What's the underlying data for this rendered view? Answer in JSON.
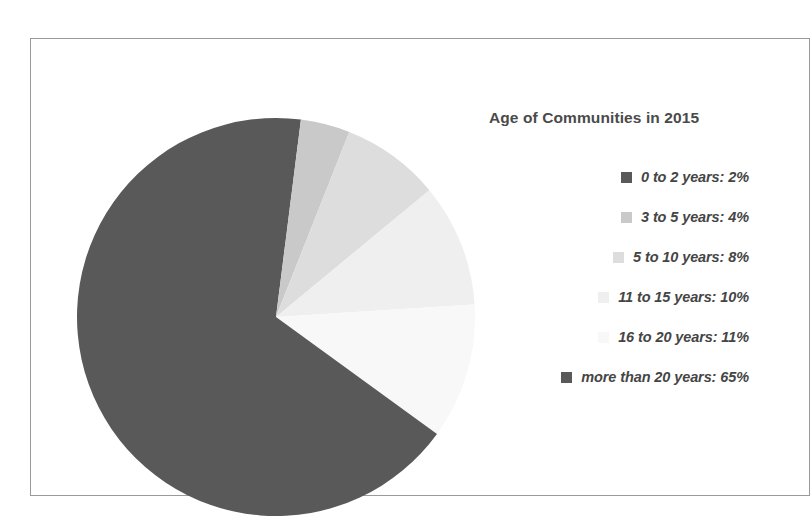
{
  "chart_data": {
    "type": "pie",
    "title": "Age of Communities in 2015",
    "categories": [
      "0 to 2 years",
      "3 to 5 years",
      "5 to 10 years",
      "11 to 15 years",
      "16 to 20 years",
      "more than 20 years"
    ],
    "values": [
      2,
      4,
      8,
      10,
      11,
      65
    ],
    "value_unit": "%",
    "legend_position": "right",
    "grid": false,
    "start_angle_deg": 0,
    "direction": "clockwise",
    "colors": [
      "#595959",
      "#c9c9c9",
      "#dddddd",
      "#efefef",
      "#f8f8f8",
      "#595959"
    ],
    "slices": [
      {
        "label": "0 to 2 years",
        "value": 2,
        "color": "#595959",
        "legend_text": "0 to 2 years: 2%"
      },
      {
        "label": "3 to 5 years",
        "value": 4,
        "color": "#c9c9c9",
        "legend_text": "3 to 5 years: 4%"
      },
      {
        "label": "5 to 10 years",
        "value": 8,
        "color": "#dddddd",
        "legend_text": "5 to 10 years: 8%"
      },
      {
        "label": "11 to 15 years",
        "value": 10,
        "color": "#efefef",
        "legend_text": "11 to 15 years: 10%"
      },
      {
        "label": "16 to 20 years",
        "value": 11,
        "color": "#f8f8f8",
        "legend_text": "16 to 20 years: 11%"
      },
      {
        "label": "more than 20 years",
        "value": 65,
        "color": "#595959",
        "legend_text": "more than 20 years: 65%"
      }
    ]
  },
  "legend": {
    "items": [
      {
        "text": "0 to 2 years: 2%",
        "color": "#595959"
      },
      {
        "text": "3 to 5 years: 4%",
        "color": "#c9c9c9"
      },
      {
        "text": "5 to 10 years: 8%",
        "color": "#dddddd"
      },
      {
        "text": "11 to 15 years: 10%",
        "color": "#efefef"
      },
      {
        "text": "16 to 20 years: 11%",
        "color": "#f8f8f8"
      },
      {
        "text": "more than 20 years: 65%",
        "color": "#595959"
      }
    ]
  },
  "frame": {
    "border_color": "#9a9a9a",
    "background": "#ffffff"
  },
  "title_color": "#4a4a4a",
  "label_color": "#454545"
}
